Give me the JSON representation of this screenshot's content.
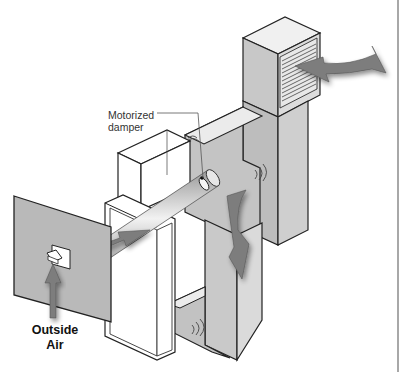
{
  "diagram": {
    "labels": {
      "damper_line1": "Motorized",
      "damper_line2": "damper",
      "outside_line1": "Outside",
      "outside_line2": "Air"
    },
    "components": [
      {
        "id": "outside-wall",
        "name": "Exterior wall panel"
      },
      {
        "id": "intake-hood",
        "name": "Outside air intake hood"
      },
      {
        "id": "fresh-air-duct",
        "name": "Fresh air duct"
      },
      {
        "id": "motorized-damper",
        "name": "Motorized damper"
      },
      {
        "id": "air-handler",
        "name": "Air handler / furnace cabinet"
      },
      {
        "id": "return-plenum",
        "name": "Return plenum box"
      },
      {
        "id": "supply-trunk",
        "name": "Supply trunk duct"
      },
      {
        "id": "supply-register",
        "name": "Supply register grille"
      }
    ],
    "arrows": [
      {
        "id": "outside-air-arrow",
        "direction": "up"
      },
      {
        "id": "duct-flow-arrow",
        "direction": "toward air handler"
      },
      {
        "id": "down-flow-arrow",
        "direction": "down"
      },
      {
        "id": "supply-out-arrow",
        "direction": "right"
      }
    ],
    "colors": {
      "panel_gray": "#b8b8b8",
      "light_gray": "#d9d9d9",
      "arrow_gray": "#7a7a7a",
      "outline": "#222222",
      "white": "#ffffff",
      "rule": "#a8a8a8"
    }
  }
}
